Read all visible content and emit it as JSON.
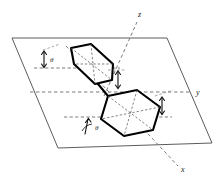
{
  "figure": {
    "background_color": "#ffffff",
    "line_color": "#000000",
    "guide_color": "#6b6b6b"
  },
  "axes": [
    {
      "id": "z",
      "label": "z",
      "position": "top",
      "style": "dashed"
    },
    {
      "id": "y",
      "label": "y",
      "position": "right",
      "style": "dashed"
    },
    {
      "id": "x",
      "label": "x",
      "position": "bottom-right",
      "style": "dashed"
    }
  ],
  "angles": [
    {
      "id": "theta-upper-left",
      "label": "θ",
      "marker": "arc-arrow"
    },
    {
      "id": "theta-lower-left",
      "label": "θ",
      "marker": "arc-arrow"
    },
    {
      "id": "theta-center",
      "label": "",
      "marker": "arrow"
    },
    {
      "id": "theta-right",
      "label": "",
      "marker": "arrow"
    }
  ],
  "rings": [
    {
      "id": "ring-upper",
      "shape": "hexagon",
      "orientation": "tilted-edge-on",
      "stroke": "#000000"
    },
    {
      "id": "ring-lower",
      "shape": "hexagon",
      "orientation": "in-plane",
      "stroke": "#000000"
    }
  ],
  "plane": {
    "id": "reference-plane",
    "shape": "parallelogram",
    "stroke": "#4a4a4a"
  }
}
